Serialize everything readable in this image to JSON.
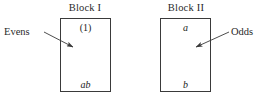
{
  "figure": {
    "width": 265,
    "height": 99,
    "background_color": "#ffffff",
    "line_color": "#3a3a3a",
    "text_color": "#1b1b1b"
  },
  "blocks": [
    {
      "title": "Block I",
      "top_label": "(1)",
      "bottom_label": "ab",
      "annotation": "Evens"
    },
    {
      "title": "Block II",
      "top_label": "a",
      "bottom_label": "b",
      "annotation": "Odds"
    }
  ],
  "annotations": {
    "evens": {
      "text": "Evens",
      "leader_from": [
        44,
        32
      ],
      "leader_to": [
        73,
        47
      ]
    },
    "odds": {
      "text": "Odds",
      "leader_from": [
        229,
        32
      ],
      "leader_to": [
        196,
        47
      ]
    }
  }
}
